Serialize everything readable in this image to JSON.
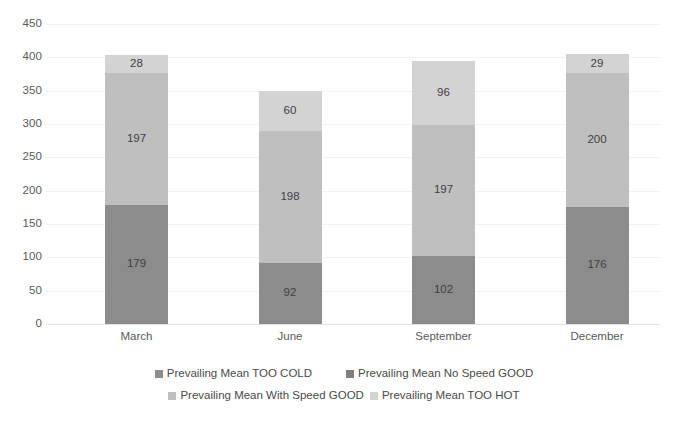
{
  "chart_data": {
    "type": "bar",
    "subtype": "stacked-bar",
    "title": "",
    "subtitle": "",
    "xlabel": "",
    "ylabel": "",
    "categories": [
      "March",
      "June",
      "September",
      "December"
    ],
    "series": [
      {
        "name": "Prevailing Mean TOO COLD",
        "color": "#8c8c8c",
        "values": [
          179,
          92,
          102,
          176
        ]
      },
      {
        "name": "Prevailing Mean No Speed GOOD",
        "color": "#7f7f7f",
        "values": [
          0,
          0,
          0,
          0
        ]
      },
      {
        "name": "Prevailing Mean With Speed GOOD",
        "color": "#bfbfbf",
        "values": [
          197,
          198,
          197,
          200
        ]
      },
      {
        "name": "Prevailing Mean TOO HOT",
        "color": "#d3d3d3",
        "values": [
          28,
          60,
          96,
          29
        ]
      }
    ],
    "totals": [
      404,
      350,
      395,
      405
    ],
    "ylim": [
      0,
      450
    ],
    "ytick_step": 50,
    "yticks": [
      "450",
      "400",
      "350",
      "300",
      "250",
      "200",
      "150",
      "100",
      "50",
      "0"
    ],
    "grid": true,
    "grid_color": "#f2f2f2",
    "legend_position": "bottom",
    "data_labels_shown": true,
    "data_labels": {
      "March": {
        "too_cold": "179",
        "with_speed_good": "197",
        "too_hot": "28"
      },
      "June": {
        "too_cold": "92",
        "with_speed_good": "198",
        "too_hot": "60"
      },
      "September": {
        "too_cold": "102",
        "with_speed_good": "197",
        "too_hot": "96"
      },
      "December": {
        "too_cold": "176",
        "with_speed_good": "200",
        "too_hot": "29"
      }
    }
  },
  "axes": {
    "y_ticks": [
      {
        "label": "450",
        "value": 450
      },
      {
        "label": "400",
        "value": 400
      },
      {
        "label": "350",
        "value": 350
      },
      {
        "label": "300",
        "value": 300
      },
      {
        "label": "250",
        "value": 250
      },
      {
        "label": "200",
        "value": 200
      },
      {
        "label": "150",
        "value": 150
      },
      {
        "label": "100",
        "value": 100
      },
      {
        "label": "50",
        "value": 50
      },
      {
        "label": "0",
        "value": 0
      }
    ],
    "x_ticks": [
      {
        "label": "March"
      },
      {
        "label": "June"
      },
      {
        "label": "September"
      },
      {
        "label": "December"
      }
    ]
  },
  "legend": {
    "rows": [
      [
        {
          "label": "Prevailing Mean TOO COLD",
          "color": "#8c8c8c"
        },
        {
          "label": "Prevailing Mean No Speed GOOD",
          "color": "#7f7f7f"
        }
      ],
      [
        {
          "label": "Prevailing Mean With Speed GOOD",
          "color": "#bfbfbf"
        },
        {
          "label": "Prevailing Mean TOO HOT",
          "color": "#d3d3d3"
        }
      ]
    ]
  }
}
